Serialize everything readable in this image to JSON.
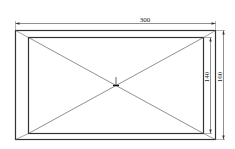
{
  "drawing": {
    "type": "rectangular frame with diagonals",
    "dimensions": {
      "outer_width": "300",
      "inner_height": "140",
      "outer_height": "160"
    },
    "colors": {
      "line": "#333333",
      "thin_line": "#666666",
      "background": "#ffffff"
    }
  }
}
